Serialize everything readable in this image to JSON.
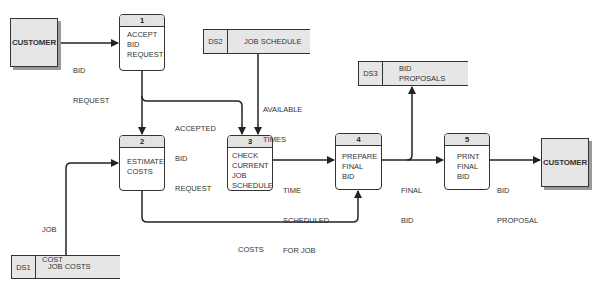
{
  "diagram": {
    "type": "data-flow-diagram",
    "external_entities": [
      {
        "id": "customer-source",
        "label": "CUSTOMER"
      },
      {
        "id": "customer-sink",
        "label": "CUSTOMER"
      }
    ],
    "processes": [
      {
        "number": "1",
        "label_lines": [
          "ACCEPT",
          "BID",
          "REQUEST"
        ]
      },
      {
        "number": "2",
        "label_lines": [
          "ESTIMATE",
          "COSTS"
        ]
      },
      {
        "number": "3",
        "label_lines": [
          "CHECK",
          "CURRENT",
          "JOB",
          "SCHEDULE"
        ]
      },
      {
        "number": "4",
        "label_lines": [
          "PREPARE",
          "FINAL",
          "BID"
        ]
      },
      {
        "number": "5",
        "label_lines": [
          "PRINT",
          "FINAL",
          "BID"
        ]
      }
    ],
    "data_stores": [
      {
        "id": "DS1",
        "name": "JOB COSTS"
      },
      {
        "id": "DS2",
        "name": "JOB SCHEDULE"
      },
      {
        "id": "DS3",
        "name_lines": [
          "BID",
          "PROPOSALS"
        ]
      }
    ],
    "flows": [
      {
        "label_lines": [
          "BID",
          "REQUEST"
        ],
        "from": "CUSTOMER",
        "to": "1"
      },
      {
        "label_lines": [
          "ACCEPTED",
          "BID",
          "REQUEST"
        ],
        "from": "1",
        "to": "2, 3"
      },
      {
        "label_lines": [
          "AVAILABLE",
          "TIMES"
        ],
        "from": "DS2",
        "to": "3"
      },
      {
        "label_lines": [
          "JOB",
          "COST"
        ],
        "from": "DS1",
        "to": "2"
      },
      {
        "label_lines": [
          "TIME",
          "SCHEDULED",
          "FOR JOB"
        ],
        "from": "3",
        "to": "4"
      },
      {
        "label_lines": [
          "COSTS"
        ],
        "from": "2",
        "to": "4"
      },
      {
        "label_lines": [
          "FINAL",
          "BID"
        ],
        "from": "4",
        "to": "5, DS3"
      },
      {
        "label_lines": [
          "BID",
          "PROPOSAL"
        ],
        "from": "5",
        "to": "CUSTOMER"
      }
    ]
  },
  "colors": {
    "line": "#222222",
    "box_fill": "#e6e6e6",
    "header_fill": "#e3e3e3",
    "shadow": "#9a9a9a"
  }
}
